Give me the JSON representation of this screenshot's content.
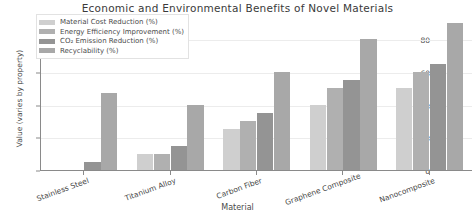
{
  "chart_data": {
    "type": "bar",
    "title": "Economic and Environmental Benefits of Novel Materials",
    "xlabel": "Material",
    "ylabel": "Value (varies by property)",
    "categories": [
      "Stainless Steel",
      "Titanium Alloy",
      "Carbon Fiber",
      "Graphene Composite",
      "Nanocomposite"
    ],
    "series": [
      {
        "name": "Material Cost Reduction (%)",
        "color": "#cfcfcf",
        "values": [
          0,
          10,
          25,
          40,
          50
        ]
      },
      {
        "name": "Energy Efficiency Improvement (%)",
        "color": "#b0b0b0",
        "values": [
          0,
          10,
          30,
          50,
          60
        ]
      },
      {
        "name": "CO₂ Emission Reduction (%)",
        "color": "#949494",
        "values": [
          5,
          15,
          35,
          55,
          65
        ]
      },
      {
        "name": "Recyclability (%)",
        "color": "#a8a8a8",
        "values": [
          47,
          40,
          60,
          80,
          90
        ]
      }
    ],
    "yticks": [
      0,
      20,
      40,
      60,
      80
    ],
    "ylim": [
      0,
      95
    ],
    "grid": true,
    "legend_position": "upper left"
  }
}
